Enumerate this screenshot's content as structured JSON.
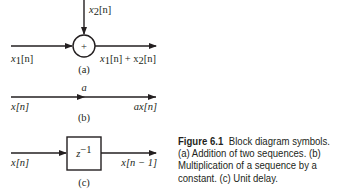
{
  "diagram_a": {
    "input1": "x",
    "input1_sub": "1",
    "input2": "x",
    "input2_sub": "2",
    "arg": "[n]",
    "adder_symbol": "+",
    "output_parts": [
      "x",
      "1",
      "[n] + x",
      "2",
      "[n]"
    ],
    "label": "(a)"
  },
  "diagram_b": {
    "input": "x[n]",
    "gain": "a",
    "output": "ax[n]",
    "label": "(b)"
  },
  "diagram_c": {
    "input": "x[n]",
    "block": "z",
    "block_exp": "−1",
    "output": "x[n − 1]",
    "label": "(c)"
  },
  "caption": {
    "figure": "Figure 6.1",
    "text": "Block diagram symbols. (a) Addition of two sequences. (b) Multiplication of a sequence by a constant. (c) Unit delay."
  }
}
